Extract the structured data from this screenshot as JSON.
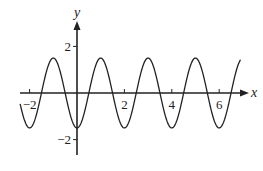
{
  "chart_data": {
    "type": "line",
    "title": "",
    "xlabel": "x",
    "ylabel": "y",
    "function": "y = -1.5 cos(pi x)",
    "x_range": [
      -2.4,
      6.9
    ],
    "xlim": [
      -2.4,
      7.2
    ],
    "ylim": [
      -3.2,
      3.0
    ],
    "x_ticks": [
      -2,
      2,
      4,
      6
    ],
    "x_tick_labels": [
      "−2",
      "2",
      "4",
      "6"
    ],
    "y_ticks": [
      2,
      -2
    ],
    "y_tick_labels": [
      "2",
      "−2"
    ],
    "amplitude": 1.5,
    "period": 2,
    "series": [
      {
        "name": "curve",
        "x": [
          -2,
          -1,
          0,
          1,
          2,
          3,
          4,
          5,
          6
        ],
        "y": [
          -1.5,
          1.5,
          -1.5,
          1.5,
          -1.5,
          1.5,
          -1.5,
          1.5,
          -1.5
        ]
      }
    ],
    "grid": false,
    "legend": null
  },
  "layout": {
    "origin_px": [
      77,
      93
    ],
    "px_per_unit_x": 23.7,
    "px_per_unit_y": 23.3,
    "stroke_color": "#222222"
  }
}
